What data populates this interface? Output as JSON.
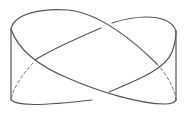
{
  "diagram": {
    "title": "Twisted band diagram",
    "stroke_color": "#555555",
    "dashed_color": "#777777",
    "background": "#ffffff",
    "strands": [
      {
        "name": "upper-left-arc-front",
        "d": "M11,29 C14,14 40,8 68,10 C100,13 135,42 157,64",
        "dashed": false
      },
      {
        "name": "upper-left-arc-hidden",
        "d": "M157,64 C168,76 175,90 176,100",
        "dashed": true
      },
      {
        "name": "left-descending-band",
        "d": "M11,29 C18,50 38,66 70,79 C100,92 140,104 165,104 C171,104 175,102 176,100",
        "dashed": false
      },
      {
        "name": "bottom-left-arc",
        "d": "M11,100 C18,106 40,106 92,100",
        "dashed": false
      },
      {
        "name": "rising-band",
        "d": "M109,92 C135,81 165,70 172,52 C175,44 176,36 176,31",
        "dashed": false
      },
      {
        "name": "upper-right-arc",
        "d": "M176,31 C170,14 140,14 112,23",
        "dashed": false
      },
      {
        "name": "middle-descending-band",
        "d": "M101,28 C80,37 52,49 35,60",
        "dashed": false
      },
      {
        "name": "left-hidden-arc",
        "d": "M33,63 C22,75 13,88 11,100",
        "dashed": true
      },
      {
        "name": "left-edge",
        "d": "M11,29 L11,100",
        "dashed": false
      },
      {
        "name": "right-edge",
        "d": "M176,31 L176,100",
        "dashed": false
      }
    ]
  }
}
